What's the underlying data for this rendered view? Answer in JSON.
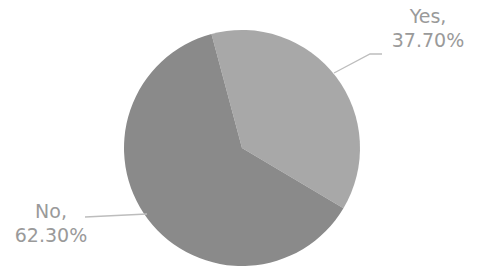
{
  "chart_data": {
    "type": "pie",
    "title": "",
    "categories": [
      "Yes",
      "No"
    ],
    "values": [
      37.7,
      62.3
    ],
    "labels": [
      "Yes,\n37.70%",
      "No,\n62.30%"
    ],
    "colors": [
      "#a8a8a8",
      "#8a8a8a"
    ],
    "start_angle_deg": -15,
    "legend": "none",
    "data_labels": "outside with leader lines"
  },
  "labels": {
    "yes_name": "Yes,",
    "yes_value": "37.70%",
    "no_name": "No,",
    "no_value": "62.30%"
  }
}
